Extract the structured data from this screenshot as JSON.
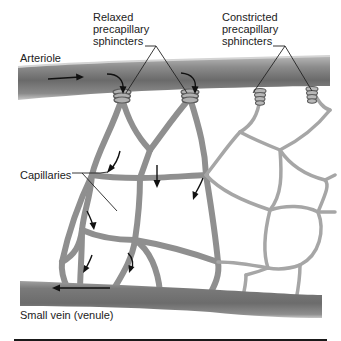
{
  "figure": {
    "labels": {
      "relaxed": "Relaxed\nprecapillary\nsphincters",
      "constricted": "Constricted\nprecapillary\nsphincters",
      "arteriole": "Arteriole",
      "capillaries": "Capillaries",
      "venule": "Small vein (venule)"
    },
    "colors": {
      "vessel_dark": "#6e6e6e",
      "vessel_mid": "#8a8a8a",
      "vessel_light": "#b4b4b4",
      "capillary": "#9a9a9a",
      "arrow": "#111111",
      "text": "#222222"
    },
    "flow_directions": {
      "arteriole": "left-to-right",
      "venule": "right-to-left"
    }
  }
}
